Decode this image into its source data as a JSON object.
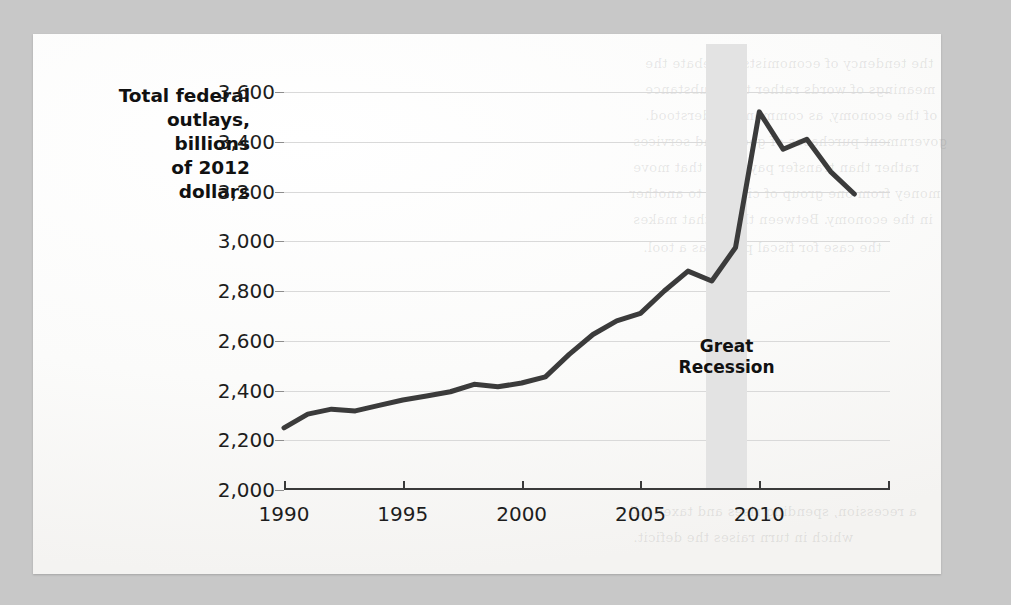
{
  "page": {
    "background_color": "#c8c8c8",
    "paper_color": "#fbfbfa",
    "ghost_text": [
      "the tendency of economists to debate the",
      "meanings of words rather than substance",
      "of the economy, as commonly understood.",
      "government purchases of goods and services",
      "rather than transfer payments that move",
      "money from one group of citizens to another",
      "in the economy. Between them, that makes",
      "the case for fiscal policy as a tool.",
      "a recession, spending rises and taxes fall",
      "which in turn raises the deficit."
    ]
  },
  "chart_data": {
    "type": "line",
    "title": "",
    "xlabel": "",
    "ylabel": "Total federal outlays, billions of 2012 dollars",
    "axis_title_lines": [
      "Total federal",
      "outlays,",
      "billions",
      "of 2012",
      "dollars"
    ],
    "xlim": [
      1990,
      2015.5
    ],
    "ylim": [
      2000,
      3600
    ],
    "yticks": [
      2000,
      2200,
      2400,
      2600,
      2800,
      3000,
      3200,
      3400,
      3600
    ],
    "ytick_labels": [
      "2,000",
      "2,200",
      "2,400",
      "2,600",
      "2,800",
      "3,000",
      "3,200",
      "3,400",
      "3,600"
    ],
    "xticks": [
      1990,
      1995,
      2000,
      2005,
      2010
    ],
    "xtick_labels": [
      "1990",
      "1995",
      "2000",
      "2005",
      "2010"
    ],
    "grid": "horizontal",
    "legend": "none",
    "line_color": "#3b3b3b",
    "line_width": 5,
    "x": [
      1990,
      1991,
      1992,
      1993,
      1994,
      1995,
      1996,
      1997,
      1998,
      1999,
      2000,
      2001,
      2002,
      2003,
      2004,
      2005,
      2006,
      2007,
      2008,
      2009,
      2010,
      2011,
      2012,
      2013,
      2014
    ],
    "values": [
      2250,
      2305,
      2325,
      2318,
      2340,
      2362,
      2378,
      2395,
      2425,
      2415,
      2430,
      2455,
      2545,
      2625,
      2680,
      2710,
      2800,
      2880,
      2840,
      2975,
      3520,
      3370,
      3410,
      3280,
      3190
    ],
    "annotations": [
      {
        "label": "Great Recession",
        "label_lines": [
          "Great",
          "Recession"
        ],
        "type": "shaded-band",
        "x_start": 2007.75,
        "x_end": 2009.5,
        "color": "#e3e3e3"
      }
    ]
  }
}
